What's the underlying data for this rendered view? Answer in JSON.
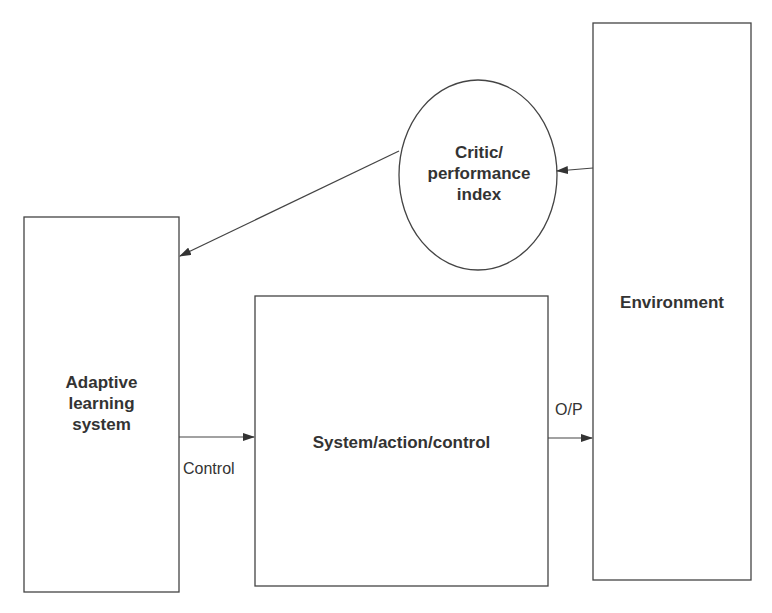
{
  "diagram": {
    "type": "block-diagram",
    "nodes": {
      "adaptive": {
        "label_lines": [
          "Adaptive",
          "learning",
          "system"
        ],
        "shape": "rectangle"
      },
      "system": {
        "label": "System/action/control",
        "shape": "rectangle"
      },
      "environment": {
        "label": "Environment",
        "shape": "rectangle"
      },
      "critic": {
        "label_lines": [
          "Critic/",
          "performance",
          "index"
        ],
        "shape": "ellipse"
      }
    },
    "edges": [
      {
        "from": "adaptive",
        "to": "system",
        "label": "Control"
      },
      {
        "from": "system",
        "to": "environment",
        "label": "O/P"
      },
      {
        "from": "environment",
        "to": "critic",
        "label": ""
      },
      {
        "from": "critic",
        "to": "adaptive",
        "label": ""
      }
    ],
    "colors": {
      "stroke": "#444444",
      "text": "#333333",
      "background": "#ffffff"
    }
  }
}
